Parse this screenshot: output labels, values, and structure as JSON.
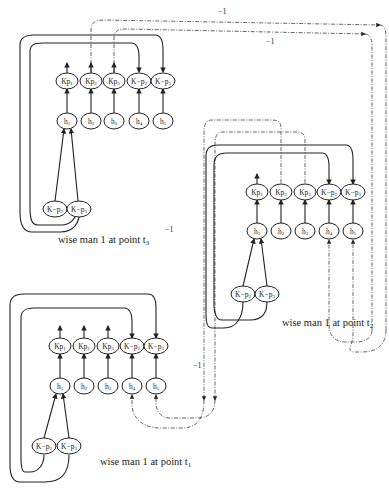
{
  "diagram": {
    "panels": [
      {
        "id": "t3",
        "caption": "wise man 1 at point t",
        "caption_sub": "3",
        "top_row": [
          {
            "label": "Kp",
            "sub": "1"
          },
          {
            "label": "Kp",
            "sub": "2"
          },
          {
            "label": "Kp",
            "sub": "3"
          },
          {
            "label": "K−p",
            "sub": "2"
          },
          {
            "label": "K−p",
            "sub": "3"
          }
        ],
        "mid_row": [
          {
            "label": "h",
            "sub": "1"
          },
          {
            "label": "h",
            "sub": "2"
          },
          {
            "label": "h",
            "sub": "3"
          },
          {
            "label": "h",
            "sub": "4"
          },
          {
            "label": "h",
            "sub": "5"
          }
        ],
        "bottom_row": [
          {
            "label": "K−p",
            "sub": "2"
          },
          {
            "label": "K−p",
            "sub": "3"
          }
        ]
      },
      {
        "id": "t2",
        "caption": "wise man 1 at point t",
        "caption_sub": "2",
        "top_row": [
          {
            "label": "Kp",
            "sub": "1"
          },
          {
            "label": "Kp",
            "sub": "2"
          },
          {
            "label": "Kp",
            "sub": "3"
          },
          {
            "label": "K−p",
            "sub": "2"
          },
          {
            "label": "K−p",
            "sub": "3"
          }
        ],
        "mid_row": [
          {
            "label": "h",
            "sub": "1"
          },
          {
            "label": "h",
            "sub": "2"
          },
          {
            "label": "h",
            "sub": "3"
          },
          {
            "label": "h",
            "sub": "4"
          },
          {
            "label": "h",
            "sub": "5"
          }
        ],
        "bottom_row": [
          {
            "label": "K−p",
            "sub": "2"
          },
          {
            "label": "K−p",
            "sub": "3"
          }
        ]
      },
      {
        "id": "t1",
        "caption": "wise man 1 at point t",
        "caption_sub": "1",
        "top_row": [
          {
            "label": "Kp",
            "sub": "1"
          },
          {
            "label": "Kp",
            "sub": "2"
          },
          {
            "label": "Kp",
            "sub": "3"
          },
          {
            "label": "K−p",
            "sub": "2"
          },
          {
            "label": "K−p",
            "sub": "3"
          }
        ],
        "mid_row": [
          {
            "label": "h",
            "sub": "1"
          },
          {
            "label": "h",
            "sub": "2"
          },
          {
            "label": "h",
            "sub": "3"
          },
          {
            "label": "h",
            "sub": "4"
          },
          {
            "label": "h",
            "sub": "5"
          }
        ],
        "bottom_row": [
          {
            "label": "K−p",
            "sub": "2"
          },
          {
            "label": "K−p",
            "sub": "3"
          }
        ]
      }
    ],
    "edge_labels": [
      "−1",
      "−1",
      "−1",
      "−1"
    ],
    "colors": {
      "line": "#222222",
      "dashed": "#555555",
      "background": "#ffffff"
    }
  }
}
